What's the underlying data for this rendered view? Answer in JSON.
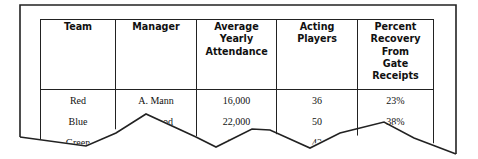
{
  "table": {
    "headers": [
      {
        "label": "Team"
      },
      {
        "label": "Manager"
      },
      {
        "label": "Average Yearly Attendance"
      },
      {
        "label": "Acting Players"
      },
      {
        "label": "Percent Recovery From Gate Receipts"
      }
    ],
    "rows": [
      {
        "team": "Red",
        "manager": "A. Mann",
        "attendance": "16,000",
        "players": "36",
        "recovery": "23%"
      },
      {
        "team": "Blue",
        "manager": "B. Good",
        "attendance": "22,000",
        "players": "50",
        "recovery": "38%"
      },
      {
        "team": "Green",
        "manager": "",
        "attendance": "20,5",
        "players": "42",
        "recovery": ""
      }
    ]
  },
  "colors": {
    "line": "#222222",
    "text": "#111111",
    "background": "#ffffff"
  }
}
